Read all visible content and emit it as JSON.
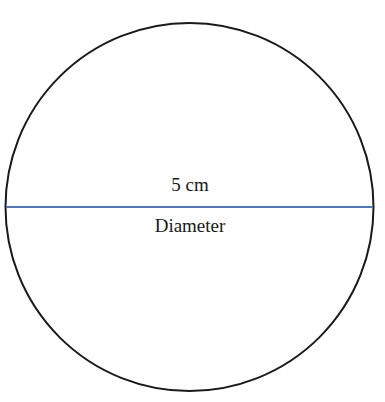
{
  "diagram": {
    "shape": "circle",
    "measurement_label": "5 cm",
    "line_label": "Diameter",
    "colors": {
      "circle_stroke": "#1a1a1a",
      "diameter_line": "#4a78c2",
      "background": "#ffffff"
    }
  }
}
